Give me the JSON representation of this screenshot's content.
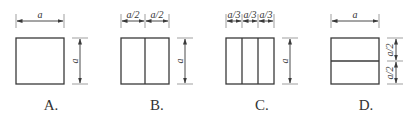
{
  "figure": {
    "options": [
      {
        "id": "A",
        "label": "A.",
        "top_dimensions": [
          "a"
        ],
        "right_dimensions": [
          "a"
        ],
        "divisions": "none"
      },
      {
        "id": "B",
        "label": "B.",
        "top_dimensions": [
          "a/2",
          "a/2"
        ],
        "right_dimensions": [
          "a"
        ],
        "divisions": "2 vertical strips"
      },
      {
        "id": "C",
        "label": "C.",
        "top_dimensions": [
          "a/3",
          "a/3",
          "a/3"
        ],
        "right_dimensions": [
          "a"
        ],
        "divisions": "3 vertical strips"
      },
      {
        "id": "D",
        "label": "D.",
        "top_dimensions": [
          "a"
        ],
        "right_dimensions": [
          "a/2",
          "a/2"
        ],
        "divisions": "2 horizontal strips"
      }
    ]
  },
  "colors": {
    "line": "#3a3a3a",
    "background": "#ffffff"
  }
}
